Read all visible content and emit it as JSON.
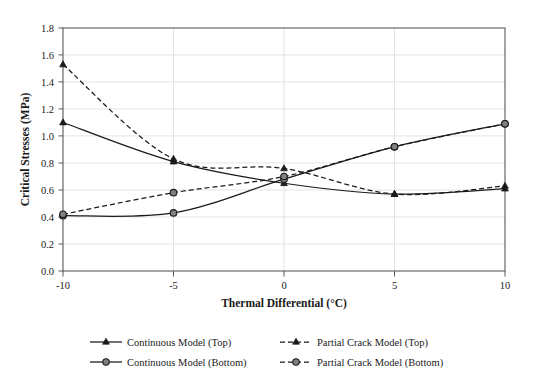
{
  "chart_data": {
    "type": "line",
    "title": "",
    "xlabel": "Thermal Differential (°C)",
    "ylabel": "Critical Stresses (MPa)",
    "x": [
      -10,
      -5,
      0,
      5,
      10
    ],
    "xticklabels": [
      "-10",
      "-5",
      "0",
      "5",
      "10"
    ],
    "yticklabels": [
      "0.0",
      "0.2",
      "0.4",
      "0.6",
      "0.8",
      "1.0",
      "1.2",
      "1.4",
      "1.6",
      "1.8"
    ],
    "xlim": [
      -10,
      10
    ],
    "ylim": [
      0.0,
      1.8
    ],
    "grid": true,
    "legend_position": "bottom",
    "series": [
      {
        "name": "Continuous Model (Top)",
        "linestyle": "solid",
        "marker": "triangle",
        "values": [
          1.1,
          0.81,
          0.65,
          0.57,
          0.61
        ]
      },
      {
        "name": "Partial Crack Model (Top)",
        "linestyle": "dashed",
        "marker": "triangle",
        "values": [
          1.53,
          0.83,
          0.76,
          0.57,
          0.63
        ]
      },
      {
        "name": "Continuous Model (Bottom)",
        "linestyle": "solid",
        "marker": "circle",
        "values": [
          0.41,
          0.43,
          0.68,
          0.92,
          1.09
        ]
      },
      {
        "name": "Partial Crack Model (Bottom)",
        "linestyle": "dashed",
        "marker": "circle",
        "values": [
          0.42,
          0.58,
          0.7,
          0.92,
          1.09
        ]
      }
    ]
  },
  "axes": {
    "x_ticks": [
      "-10",
      "-5",
      "0",
      "5",
      "10"
    ],
    "y_ticks": [
      "0.0",
      "0.2",
      "0.4",
      "0.6",
      "0.8",
      "1.0",
      "1.2",
      "1.4",
      "1.6",
      "1.8"
    ],
    "x_axis_title": "Thermal Differential (°C)",
    "y_axis_title": "Critical Stresses (MPa)"
  },
  "legend": {
    "entries": [
      {
        "label": "Continuous Model (Top)",
        "marker": "triangle-marker",
        "linestyle": "solid"
      },
      {
        "label": "Partial Crack Model (Top)",
        "marker": "triangle-marker",
        "linestyle": "dashed"
      },
      {
        "label": "Continuous Model (Bottom)",
        "marker": "circle-marker",
        "linestyle": "solid"
      },
      {
        "label": "Partial Crack Model (Bottom)",
        "marker": "circle-marker",
        "linestyle": "dashed"
      }
    ]
  },
  "colors": {
    "line": "#1a1a1a",
    "grid": "#d9d9d9",
    "frame": "#595959",
    "marker_fill": "#808080",
    "background": "#ffffff"
  }
}
